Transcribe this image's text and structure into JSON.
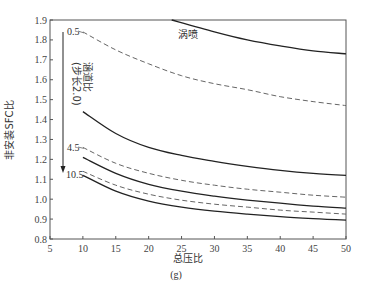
{
  "chart_data": {
    "type": "line",
    "title": "",
    "caption": "(g)",
    "xlabel": "总压比",
    "ylabel": "非安装SFC比",
    "xlim": [
      5,
      50
    ],
    "ylim": [
      0.8,
      1.9
    ],
    "xticks": [
      5,
      10,
      15,
      20,
      25,
      30,
      35,
      40,
      45,
      50
    ],
    "yticks": [
      0.8,
      0.9,
      1.0,
      1.1,
      1.2,
      1.3,
      1.4,
      1.5,
      1.6,
      1.7,
      1.8,
      1.9
    ],
    "grid": false,
    "legend": "none",
    "annotations": {
      "turbojet": "涡喷",
      "bpr_arrow_line1": "涵道比",
      "bpr_arrow_line2": "(步长2.0)",
      "label_05": "0.5",
      "label_45": "4.5",
      "label_105": "10.5"
    },
    "series": [
      {
        "name": "涡喷",
        "style": "solid",
        "x": [
          23.5,
          30,
          35,
          40,
          45,
          50
        ],
        "y": [
          1.9,
          1.84,
          1.8,
          1.77,
          1.745,
          1.73
        ]
      },
      {
        "name": "BPR 0.5",
        "style": "dashed",
        "x": [
          10,
          15,
          20,
          25,
          30,
          35,
          40,
          45,
          50
        ],
        "y": [
          1.84,
          1.75,
          1.68,
          1.62,
          1.58,
          1.55,
          1.515,
          1.49,
          1.47
        ]
      },
      {
        "name": "BPR 2.5",
        "style": "solid",
        "x": [
          10,
          15,
          20,
          25,
          30,
          35,
          40,
          45,
          50
        ],
        "y": [
          1.44,
          1.33,
          1.26,
          1.22,
          1.19,
          1.165,
          1.145,
          1.13,
          1.12
        ]
      },
      {
        "name": "BPR 4.5",
        "style": "dashed",
        "x": [
          10,
          15,
          20,
          25,
          30,
          35,
          40,
          45,
          50
        ],
        "y": [
          1.26,
          1.18,
          1.13,
          1.095,
          1.07,
          1.05,
          1.035,
          1.02,
          1.01
        ]
      },
      {
        "name": "BPR 6.5",
        "style": "solid",
        "x": [
          10,
          15,
          20,
          25,
          30,
          35,
          40,
          45,
          50
        ],
        "y": [
          1.21,
          1.13,
          1.075,
          1.04,
          1.015,
          0.995,
          0.98,
          0.965,
          0.955
        ]
      },
      {
        "name": "BPR 8.5",
        "style": "dashed",
        "x": [
          10,
          15,
          20,
          25,
          30,
          35,
          40,
          45,
          50
        ],
        "y": [
          1.14,
          1.07,
          1.025,
          0.995,
          0.975,
          0.96,
          0.945,
          0.935,
          0.925
        ]
      },
      {
        "name": "BPR 10.5",
        "style": "solid",
        "x": [
          10,
          15,
          20,
          25,
          30,
          35,
          40,
          45,
          50
        ],
        "y": [
          1.12,
          1.04,
          0.99,
          0.96,
          0.94,
          0.925,
          0.912,
          0.902,
          0.895
        ]
      }
    ]
  }
}
